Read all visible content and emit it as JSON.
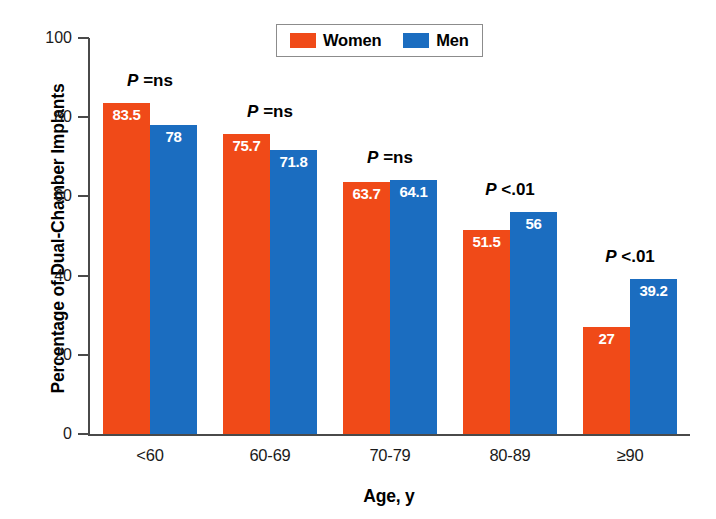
{
  "chart_data": {
    "type": "bar",
    "title": "",
    "xlabel": "Age, y",
    "ylabel": "Percentage of Dual-Chamber Implants",
    "categories": [
      "<60",
      "60-69",
      "70-79",
      "80-89",
      "≥90"
    ],
    "ylim": [
      0,
      100
    ],
    "yticks": [
      0,
      20,
      40,
      60,
      80,
      100
    ],
    "ytick_labels": [
      "0",
      "20",
      "40",
      "60",
      "80",
      "100"
    ],
    "grid": false,
    "legend_position": "top-center",
    "series": [
      {
        "name": "Women",
        "color": "#F04A18",
        "values": [
          83.5,
          75.7,
          63.7,
          51.5,
          27
        ],
        "value_labels": [
          "83.5",
          "75.7",
          "63.7",
          "51.5",
          "27"
        ]
      },
      {
        "name": "Men",
        "color": "#1B6DC0",
        "values": [
          78,
          71.8,
          64.1,
          56,
          39.2
        ],
        "value_labels": [
          "78",
          "71.8",
          "64.1",
          "56",
          "39.2"
        ]
      }
    ],
    "annotations": [
      {
        "category": "<60",
        "p_symbol": "P",
        "p_text": "=ns"
      },
      {
        "category": "60-69",
        "p_symbol": "P",
        "p_text": "=ns"
      },
      {
        "category": "70-79",
        "p_symbol": "P",
        "p_text": "=ns"
      },
      {
        "category": "80-89",
        "p_symbol": "P",
        "p_text": "<.01"
      },
      {
        "category": "≥90",
        "p_symbol": "P",
        "p_text": "<.01"
      }
    ]
  },
  "legend": {
    "items": [
      {
        "label": "Women",
        "color": "#F04A18"
      },
      {
        "label": "Men",
        "color": "#1B6DC0"
      }
    ]
  },
  "colors": {
    "women": "#F04A18",
    "men": "#1B6DC0",
    "axis": "#4a4a4a",
    "text": "#000000",
    "legend_border": "#8c8c8c",
    "background": "#ffffff"
  }
}
